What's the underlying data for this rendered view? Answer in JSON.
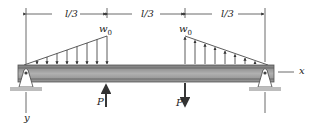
{
  "diagram": {
    "type": "beam-loading",
    "dimensions": [
      {
        "label": "l/3",
        "from_x": 26,
        "to_x": 107
      },
      {
        "label": "l/3",
        "from_x": 107,
        "to_x": 185
      },
      {
        "label": "l/3",
        "from_x": 185,
        "to_x": 265
      }
    ],
    "distributed_loads": [
      {
        "label": "w",
        "subscript": "0",
        "direction": "down",
        "shape": "triangle-increasing",
        "span": "0 to l/3"
      },
      {
        "label": "w",
        "subscript": "0",
        "direction": "up",
        "shape": "triangle-decreasing",
        "span": "2l/3 to l"
      }
    ],
    "point_loads": [
      {
        "label": "P",
        "direction": "up",
        "position": "l/3"
      },
      {
        "label": "P",
        "direction": "down",
        "position": "2l/3"
      }
    ],
    "supports": [
      {
        "type": "pin",
        "position": "left"
      },
      {
        "type": "pin",
        "position": "right"
      }
    ],
    "axes": {
      "x_label": "x",
      "y_label": "y"
    },
    "colors": {
      "beam_fill": "#9a9a9a",
      "beam_edge": "#555555",
      "line": "#333333",
      "ground": "#bdbdbd"
    }
  }
}
